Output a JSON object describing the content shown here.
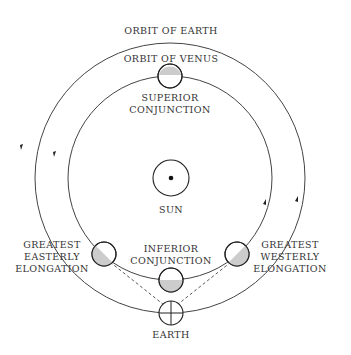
{
  "labels": {
    "orbit_earth": "ORBIT OF EARTH",
    "orbit_venus": "ORBIT OF VENUS",
    "superior_1": "SUPERIOR",
    "superior_2": "CONJUNCTION",
    "sun": "SUN",
    "inferior_1": "INFERIOR",
    "inferior_2": "CONJUNCTION",
    "east_1": "GREATEST",
    "east_2": "EASTERLY",
    "east_3": "ELONGATION",
    "west_1": "GREATEST",
    "west_2": "WESTERLY",
    "west_3": "ELONGATION",
    "earth": "EARTH"
  },
  "geometry": {
    "center": [
      170,
      178
    ],
    "earth_orbit_radius": 135,
    "venus_orbit_radius": 102,
    "sun_radius": 18,
    "planet_radius": 12
  },
  "colors": {
    "line": "#444444",
    "shade": "#cccccc",
    "text": "#333333",
    "background": "#ffffff"
  }
}
